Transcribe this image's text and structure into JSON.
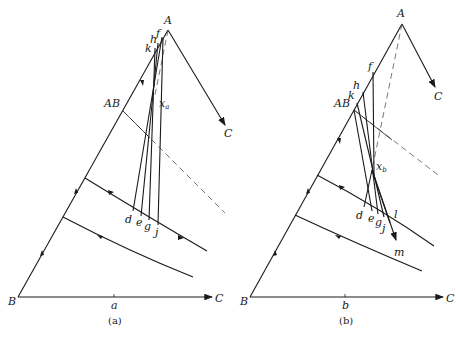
{
  "figure": {
    "panels": [
      {
        "caption": "(a)",
        "vertex_labels": {
          "A": "A",
          "B": "B",
          "C_bottom": "C",
          "C_edge": "C",
          "AB": "AB"
        },
        "axis_tick": "a",
        "point_labels": {
          "f": "f",
          "h": "h",
          "k": "k",
          "d": "d",
          "e": "e",
          "g": "g",
          "j": "j"
        },
        "center_label": "x",
        "center_sub": "a"
      },
      {
        "caption": "(b)",
        "vertex_labels": {
          "A": "A",
          "B": "B",
          "C_bottom": "C",
          "C_edge": "C",
          "AB": "AB"
        },
        "axis_tick": "b",
        "point_labels": {
          "f": "f",
          "h": "h",
          "k": "k",
          "d": "d",
          "e": "e",
          "g": "g",
          "j": "j",
          "l": "l",
          "m": "m"
        },
        "center_label": "x",
        "center_sub": "b"
      }
    ]
  }
}
